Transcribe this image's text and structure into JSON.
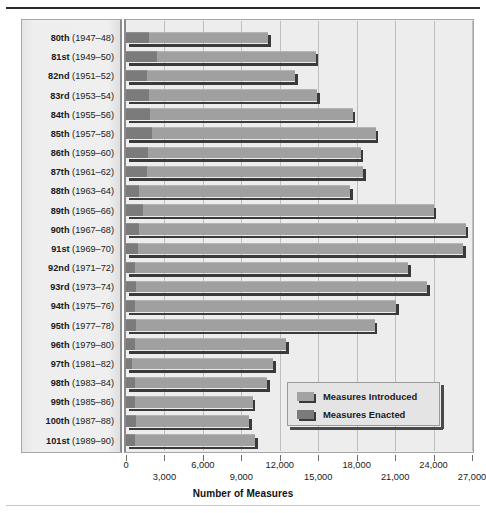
{
  "chart_data": {
    "type": "bar",
    "orientation": "horizontal",
    "title": "",
    "xlabel": "Number of Measures",
    "ylabel": "",
    "xlim": [
      0,
      27000
    ],
    "xticks": [
      0,
      3000,
      6000,
      9000,
      12000,
      15000,
      18000,
      21000,
      24000,
      27000
    ],
    "xtick_labels": [
      "0",
      "3,000",
      "6,000",
      "9,000",
      "12,000",
      "15,000",
      "18,000",
      "21,000",
      "24,000",
      "27,000"
    ],
    "grid": true,
    "legend_position": "lower-right",
    "legend": [
      "Measures Introduced",
      "Measures Enacted"
    ],
    "categories": [
      "80th (1947–48)",
      "81st (1949–50)",
      "82nd (1951–52)",
      "83rd (1953–54)",
      "84th (1955–56)",
      "85th (1957–58)",
      "86th (1959–60)",
      "87th (1961–62)",
      "88th (1963–64)",
      "89th (1965–66)",
      "90th (1967–68)",
      "91st (1969–70)",
      "92nd (1971–72)",
      "93rd (1973–74)",
      "94th (1975–76)",
      "95th (1977–78)",
      "96th (1979–80)",
      "97th (1981–82)",
      "98th (1983–84)",
      "99th (1985–86)",
      "100th (1987–88)",
      "101st (1989–90)"
    ],
    "series": [
      {
        "name": "Measures Introduced",
        "color": "#a0a0a0",
        "values": [
          11100,
          14800,
          13200,
          14900,
          17700,
          19500,
          18300,
          18500,
          17500,
          24000,
          26500,
          26300,
          22000,
          23500,
          21100,
          19400,
          12500,
          11500,
          11000,
          9900,
          9600,
          10100
        ]
      },
      {
        "name": "Measures Enacted",
        "color": "#7b7b7b",
        "values": [
          1800,
          2400,
          1600,
          1800,
          1900,
          2000,
          1700,
          1600,
          1000,
          1300,
          1000,
          900,
          700,
          800,
          700,
          800,
          700,
          500,
          700,
          700,
          800,
          700
        ]
      }
    ]
  },
  "axis": {
    "title": "Number of Measures",
    "tick_labels_upper": [
      "0",
      "6,000",
      "12,000",
      "18,000",
      "24,000"
    ],
    "tick_labels_lower": [
      "3,000",
      "9,000",
      "15,000",
      "21,000",
      "27,000"
    ]
  },
  "legend": {
    "items": [
      {
        "label": "Measures Introduced",
        "swatch": "light-gray"
      },
      {
        "label": "Measures Enacted",
        "swatch": "dark-gray"
      }
    ]
  },
  "colors": {
    "introduced": "#a0a0a0",
    "enacted": "#7b7b7b",
    "plot_background": "#ededed",
    "panel_background": "#eeeeee",
    "gridline": "#bfbfbf",
    "shadow": "#3a3a3a"
  }
}
